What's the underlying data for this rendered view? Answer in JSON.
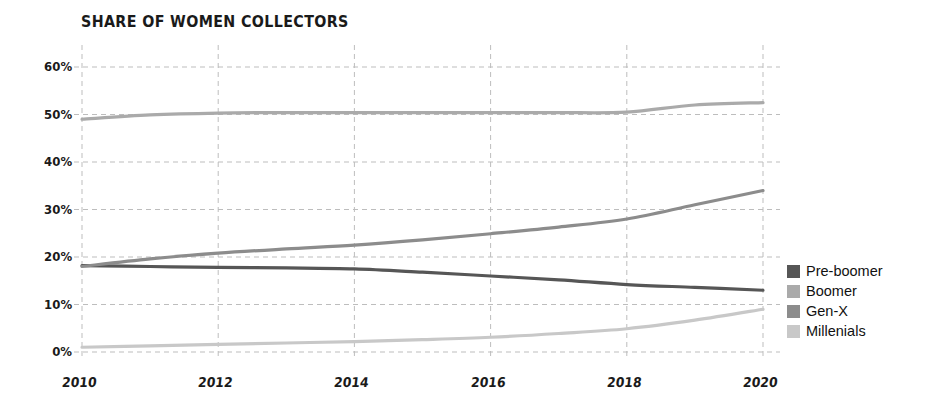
{
  "chart_data": {
    "type": "line",
    "title": "SHARE OF WOMEN COLLECTORS",
    "xlabel": "",
    "ylabel": "",
    "xlim": [
      2010,
      2020
    ],
    "ylim": [
      0,
      60
    ],
    "grid": true,
    "grid_style": "dashed",
    "legend_position": "right",
    "y_ticks": [
      "0%",
      "10%",
      "20%",
      "30%",
      "40%",
      "50%",
      "60%"
    ],
    "y_tick_values": [
      0,
      10,
      20,
      30,
      40,
      50,
      60
    ],
    "x_ticks": [
      "2010",
      "2012",
      "2014",
      "2016",
      "2018",
      "2020"
    ],
    "x_tick_values": [
      2010,
      2012,
      2014,
      2016,
      2018,
      2020
    ],
    "x": [
      2010,
      2011,
      2012,
      2013,
      2014,
      2015,
      2016,
      2017,
      2018,
      2019,
      2020
    ],
    "series": [
      {
        "name": "Pre-boomer",
        "color": "#565656",
        "values": [
          18.2,
          18.0,
          17.8,
          17.7,
          17.5,
          16.8,
          16.0,
          15.2,
          14.2,
          13.6,
          13.0
        ]
      },
      {
        "name": "Boomer",
        "color": "#aaaaaa",
        "values": [
          49.0,
          49.9,
          50.3,
          50.4,
          50.4,
          50.4,
          50.4,
          50.4,
          50.5,
          52.0,
          52.5
        ]
      },
      {
        "name": "Gen-X",
        "color": "#8c8c8c",
        "values": [
          18.0,
          19.6,
          20.8,
          21.7,
          22.5,
          23.6,
          24.9,
          26.3,
          28.0,
          31.0,
          34.0
        ]
      },
      {
        "name": "Millenials",
        "color": "#c8c8c8",
        "values": [
          1.0,
          1.3,
          1.6,
          1.9,
          2.2,
          2.6,
          3.1,
          3.9,
          4.9,
          6.7,
          9.0
        ]
      }
    ]
  },
  "legend": {
    "items": [
      {
        "label": "Pre-boomer",
        "color": "#565656"
      },
      {
        "label": "Boomer",
        "color": "#aaaaaa"
      },
      {
        "label": "Gen-X",
        "color": "#8c8c8c"
      },
      {
        "label": "Millenials",
        "color": "#c8c8c8"
      }
    ]
  },
  "colors": {
    "grid": "#bdbdbd",
    "text": "#1a1a1a",
    "background": "#ffffff"
  }
}
